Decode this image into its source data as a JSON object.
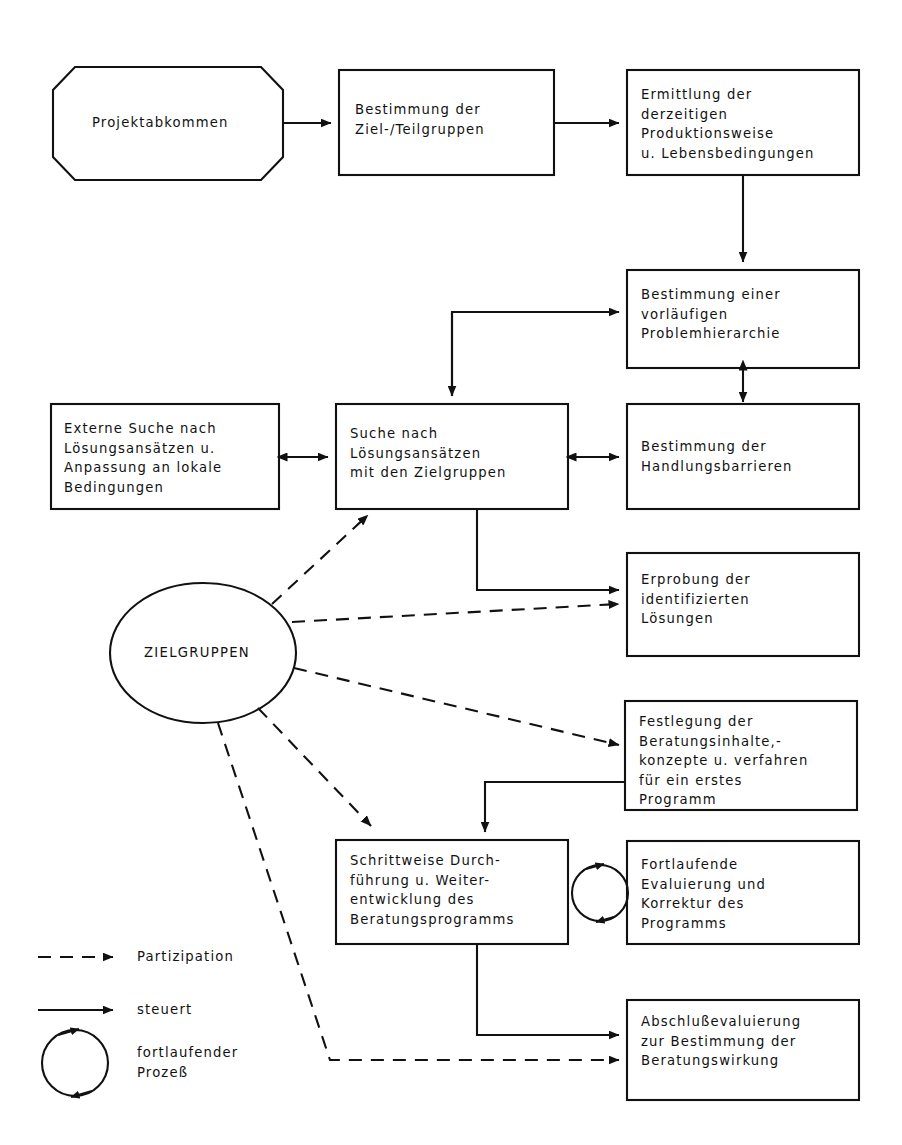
{
  "diagram": {
    "stroke_color": "#111111",
    "background_color": "#ffffff",
    "nodes": [
      {
        "id": "projektabkommen",
        "shape": "octagon",
        "text": "Projektabkommen",
        "x": 53,
        "y": 67,
        "w": 230,
        "h": 113
      },
      {
        "id": "zielgruppen-bestimmung",
        "shape": "rect",
        "text": "Bestimmung der\nZiel-/Teilgruppen",
        "x": 339,
        "y": 70,
        "w": 215,
        "h": 105
      },
      {
        "id": "ermittlung-produktionsweise",
        "shape": "rect",
        "text": "Ermittlung der\nderzeitigen\nProduktionsweise\nu. Lebensbedingungen",
        "x": 627,
        "y": 70,
        "w": 232,
        "h": 105
      },
      {
        "id": "problemhierarchie",
        "shape": "rect",
        "text": "Bestimmung einer\nvorläufigen\nProblemhierarchie",
        "x": 627,
        "y": 270,
        "w": 232,
        "h": 98
      },
      {
        "id": "externe-suche",
        "shape": "rect",
        "text": "Externe Suche nach\nLösungsansätzen u.\nAnpassung an lokale\nBedingungen",
        "x": 51,
        "y": 404,
        "w": 228,
        "h": 105
      },
      {
        "id": "suche-loesungsansaetze",
        "shape": "rect",
        "text": "Suche nach\nLösungsansätzen\nmit den Zielgruppen",
        "x": 336,
        "y": 404,
        "w": 232,
        "h": 105
      },
      {
        "id": "handlungsbarrieren",
        "shape": "rect",
        "text": "Bestimmung der\nHandlungsbarrieren",
        "x": 627,
        "y": 404,
        "w": 232,
        "h": 105
      },
      {
        "id": "erprobung",
        "shape": "rect",
        "text": "Erprobung der\nidentifizierten\nLösungen",
        "x": 627,
        "y": 553,
        "w": 232,
        "h": 103
      },
      {
        "id": "zielgruppen-ellipse",
        "shape": "ellipse",
        "text": "ZIELGRUPPEN",
        "cx": 203,
        "cy": 653,
        "rx": 93,
        "ry": 70
      },
      {
        "id": "festlegung-beratungsinhalte",
        "shape": "rect",
        "text": "Festlegung der\nBeratungsinhalte,-\nkonzepte u. verfahren\nfür ein erstes\nProgramm",
        "x": 625,
        "y": 701,
        "w": 232,
        "h": 109
      },
      {
        "id": "schrittweise-durchfuehrung",
        "shape": "rect",
        "text": "Schrittweise Durch-\nführung u. Weiter-\nentwicklung des\nBeratungsprogramms",
        "x": 336,
        "y": 840,
        "w": 232,
        "h": 104
      },
      {
        "id": "fortlaufende-evaluierung",
        "shape": "rect",
        "text": "Fortlaufende\nEvaluierung und\nKorrektur des\nProgramms",
        "x": 627,
        "y": 841,
        "w": 232,
        "h": 103
      },
      {
        "id": "abschlussevaluierung",
        "shape": "rect",
        "text": "Abschlußevaluierung\nzur Bestimmung der\nBeratungswirkung",
        "x": 627,
        "y": 1000,
        "w": 232,
        "h": 100
      }
    ],
    "process_loop": {
      "id": "fortlaufender-prozess-symbol",
      "cx": 600,
      "cy": 893,
      "r": 28
    },
    "legend": {
      "items": [
        {
          "id": "partizipation",
          "style": "dashed-arrow",
          "label": "Partizipation"
        },
        {
          "id": "steuert",
          "style": "solid-arrow",
          "label": "steuert"
        },
        {
          "id": "fortlaufender-prozess",
          "style": "circular-arrow",
          "label": "fortlaufender\nProzeß"
        }
      ]
    }
  }
}
